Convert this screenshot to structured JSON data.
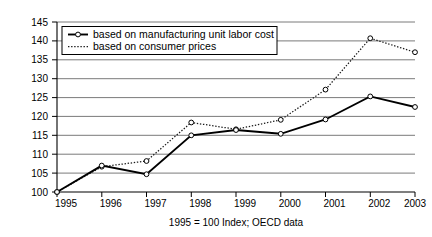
{
  "chart_data": {
    "type": "line",
    "title": "",
    "subtitle": "",
    "caption": "1995 = 100 Index; OECD data",
    "xlabel": "",
    "ylabel": "",
    "categories": [
      "1995",
      "1996",
      "1997",
      "1998",
      "1999",
      "2000",
      "2001",
      "2002",
      "2003"
    ],
    "x": [
      1995,
      1996,
      1997,
      1998,
      1999,
      2000,
      2001,
      2002,
      2003
    ],
    "series": [
      {
        "name": "based on manufacturing unit labor cost",
        "style": "solid-with-open-circle-markers",
        "values": [
          100,
          107,
          104.7,
          115,
          116.4,
          115.4,
          119.2,
          125.3,
          122.5
        ]
      },
      {
        "name": "based on consumer prices",
        "style": "dotted",
        "values": [
          100,
          106.7,
          108.2,
          118.4,
          116.6,
          119.1,
          127.1,
          140.7,
          137
        ]
      }
    ],
    "ylim": [
      100,
      145
    ],
    "ytick_values": [
      100,
      105,
      110,
      115,
      120,
      125,
      130,
      135,
      140,
      145
    ],
    "ytick_labels": [
      "100",
      "105",
      "110",
      "115",
      "120",
      "125",
      "130",
      "135",
      "140",
      "145"
    ],
    "xlim": [
      1995,
      2003
    ],
    "grid": "horizontal",
    "legend_position": "top-left-inside"
  },
  "legend": {
    "entries": [
      {
        "label": "based on manufacturing unit labor cost"
      },
      {
        "label": "based on consumer prices"
      }
    ]
  },
  "axes": {
    "y_labels": [
      "145",
      "140",
      "135",
      "130",
      "125",
      "120",
      "115",
      "110",
      "105",
      "100"
    ],
    "x_labels": [
      "1995",
      "1996",
      "1997",
      "1998",
      "1999",
      "2000",
      "2001",
      "2002",
      "2003"
    ]
  },
  "caption": {
    "text": "1995 = 100 Index; OECD data"
  }
}
